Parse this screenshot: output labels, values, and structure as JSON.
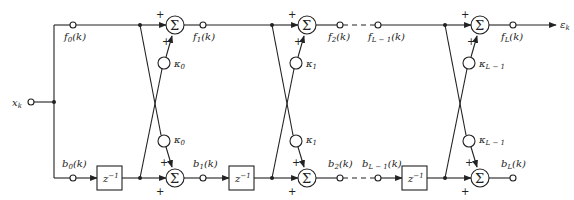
{
  "diagram": {
    "input_label": "x_k",
    "output_label": "ε_k",
    "plus_sign": "+",
    "sigma_symbol": "Σ",
    "delay_label": "z⁻¹",
    "stages": [
      {
        "kappa_label": "κ0",
        "f_in": "f0(k)",
        "b_in": "b0(k)",
        "f_out": "f1(k)",
        "b_out": "b1(k)"
      },
      {
        "kappa_label": "κ1",
        "f_in": "f1(k)",
        "b_in": "b1(k)",
        "f_out": "f2(k)",
        "b_out": "b2(k)"
      },
      {
        "kappa_label": "κL−1",
        "f_in": "fL−1(k)",
        "b_in": "bL−1(k)",
        "f_out": "fL(k)",
        "b_out": "bL(k)"
      }
    ],
    "labels": {
      "f0": {
        "base": "f",
        "sub": "0",
        "arg": "(k)"
      },
      "b0": {
        "base": "b",
        "sub": "0",
        "arg": "(k)"
      },
      "f1": {
        "base": "f",
        "sub": "1",
        "arg": "(k)"
      },
      "b1": {
        "base": "b",
        "sub": "1",
        "arg": "(k)"
      },
      "f2": {
        "base": "f",
        "sub": "2",
        "arg": "(k)"
      },
      "b2": {
        "base": "b",
        "sub": "2",
        "arg": "(k)"
      },
      "fLm1": {
        "base": "f",
        "sub": "L − 1",
        "arg": "(k)"
      },
      "bLm1": {
        "base": "b",
        "sub": "L − 1",
        "arg": "(k)"
      },
      "fL": {
        "base": "f",
        "sub": "L",
        "arg": "(k)"
      },
      "bL": {
        "base": "b",
        "sub": "L",
        "arg": "(k)"
      },
      "k0": {
        "base": "κ",
        "sub": "0"
      },
      "k1": {
        "base": "κ",
        "sub": "1"
      },
      "kLm1": {
        "base": "κ",
        "sub": "L − 1"
      },
      "xk": {
        "base": "x",
        "sub": "k"
      },
      "ek": {
        "base": "ε",
        "sub": "k"
      },
      "z": {
        "base": "z",
        "sup": "−1"
      }
    }
  }
}
